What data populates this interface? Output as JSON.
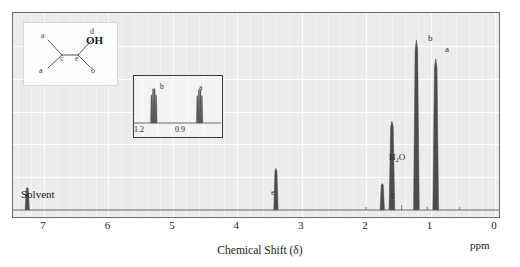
{
  "figure": {
    "kind": "nmr-spectrum",
    "compound": "2-methyl-1-propanol (isobutanol)"
  },
  "axis": {
    "title": "Chemical Shift (δ)",
    "unit_label": "ppm",
    "tick_labels": [
      "7",
      "6",
      "5",
      "4",
      "3",
      "2",
      "1",
      "0"
    ],
    "ticks": [
      7,
      6,
      5,
      4,
      3,
      2,
      1,
      0
    ],
    "xmin_ppm": 0,
    "xmax_ppm": 7.6,
    "direction": "right-to-left"
  },
  "annotations": {
    "solvent_label": "Solvent",
    "water_label": "H",
    "water_sub": "2",
    "water_label_end": "O",
    "peak_a": "a",
    "peak_b": "b",
    "peak_c": "c",
    "peak_e": "e"
  },
  "structure_inset": {
    "atom_labels": {
      "a_left": "a",
      "a_lower": "a",
      "b": "b",
      "c": "c",
      "e": "e",
      "d": "d",
      "oh": "OH"
    }
  },
  "expansion_inset": {
    "tick_labels": [
      "1.2",
      "0.9"
    ],
    "peak_b": "b",
    "peak_a": "a"
  },
  "colors": {
    "plot_background": "#ececed",
    "grid": "#fdfdfd",
    "frame": "#6e6e70",
    "trace": "#4c4c50",
    "text": "#1d1d1d"
  },
  "chart_data": {
    "type": "line",
    "title": "",
    "xlabel": "Chemical Shift (δ)",
    "ylabel": "",
    "xlim": [
      7.6,
      0.0
    ],
    "ylim": [
      0,
      100
    ],
    "grid": true,
    "legend": "none",
    "series": [
      {
        "name": "1H NMR spectrum",
        "peaks": [
          {
            "label": "Solvent",
            "shift_ppm": 7.26,
            "height": 12,
            "assignment": "CDCl3 residual"
          },
          {
            "label": "e",
            "shift_ppm": 3.4,
            "height": 22,
            "assignment": "CH2-OH"
          },
          {
            "label": "c",
            "shift_ppm": 1.75,
            "height": 14,
            "assignment": "CH methine"
          },
          {
            "label": "H2O",
            "shift_ppm": 1.6,
            "height": 47,
            "assignment": "water"
          },
          {
            "label": "b",
            "shift_ppm": 1.22,
            "height": 90,
            "assignment": "OH / CH"
          },
          {
            "label": "a",
            "shift_ppm": 0.92,
            "height": 80,
            "assignment": "(CH3)2 doublet"
          }
        ]
      }
    ],
    "expansion": {
      "xlim": [
        1.35,
        0.78
      ],
      "ticks": [
        1.2,
        0.9
      ],
      "multiplets": [
        {
          "label": "b",
          "center_ppm": 1.21,
          "lines": [
            1.235,
            1.225,
            1.215,
            1.205
          ],
          "height": 82
        },
        {
          "label": "a",
          "center_ppm": 0.92,
          "lines": [
            0.935,
            0.925,
            0.915,
            0.905
          ],
          "height": 80
        }
      ]
    }
  }
}
